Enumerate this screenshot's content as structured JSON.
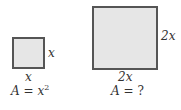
{
  "small_square": {
    "side_right_label": "x",
    "side_bottom_label": "x",
    "area_label": "A",
    "area_equals": "=",
    "area_var": "x",
    "area_exponent": "2"
  },
  "large_square": {
    "side_right_label": "2x",
    "side_bottom_label": "2x",
    "area_label": "A",
    "area_equals": "=",
    "area_value": "?"
  },
  "colors": {
    "fill": "#e6e6e6",
    "border": "#555555"
  }
}
